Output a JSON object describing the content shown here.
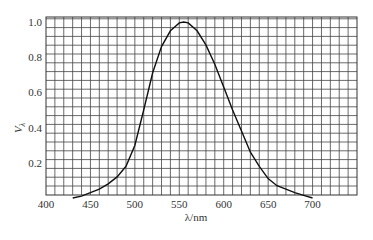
{
  "chart_data": {
    "type": "line",
    "title": "",
    "xlabel": "λ/nm",
    "ylabel": "V_λ",
    "xlim": [
      400,
      750
    ],
    "ylim": [
      0,
      1.02
    ],
    "grid": true,
    "legend": null,
    "x_ticks": [
      "400",
      "450",
      "500",
      "550",
      "600",
      "650",
      "700"
    ],
    "y_ticks": [
      "0.2",
      "0.4",
      "0.6",
      "0.8",
      "1.0"
    ],
    "series": [
      {
        "name": "V_λ (photopic luminous efficiency)",
        "x": [
          430,
          440,
          450,
          460,
          470,
          480,
          490,
          500,
          510,
          520,
          530,
          540,
          550,
          555,
          560,
          570,
          580,
          590,
          600,
          610,
          620,
          630,
          640,
          650,
          660,
          670,
          680,
          690,
          700
        ],
        "y": [
          0.0,
          0.01,
          0.03,
          0.05,
          0.08,
          0.12,
          0.18,
          0.3,
          0.5,
          0.71,
          0.86,
          0.95,
          0.995,
          1.0,
          0.995,
          0.95,
          0.87,
          0.76,
          0.63,
          0.5,
          0.38,
          0.26,
          0.18,
          0.11,
          0.07,
          0.05,
          0.03,
          0.015,
          0.0
        ]
      }
    ]
  }
}
